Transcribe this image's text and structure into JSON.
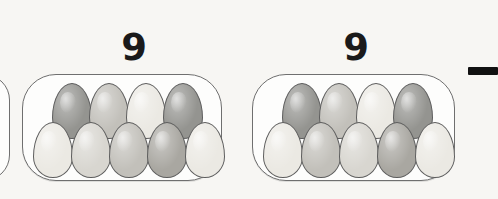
{
  "canvas": {
    "width": 494,
    "height": 199,
    "background": "#f7f6f3"
  },
  "worksheet": {
    "kind": "egg-carton-counting",
    "description": "Two egg cartons each holding nine eggs, labelled with the numeral 9, plus a partially visible carton at the left edge and a dash mark at the upper right.",
    "egg_rows_per_carton": [
      4,
      5
    ],
    "eggs_per_carton": 9
  },
  "labels": {
    "carton_1_count": "9",
    "carton_2_count": "9"
  },
  "colors": {
    "egg_outline": "#5e5e5e",
    "carton_outline": "#6f6f6f",
    "carton_fill": "#fdfdfc",
    "background": "#f7f6f3",
    "dash": "#111111",
    "egg_light": "#ebe9e3",
    "egg_medium_light": "#d8d6d0",
    "egg_medium": "#c2c0ba",
    "egg_medium_dark": "#a9a7a1",
    "egg_dark": "#949490"
  },
  "cartons": [
    {
      "id": "carton-partial-left",
      "partial": true,
      "x": -42,
      "y": 74,
      "w": 52,
      "h": 107,
      "label": null,
      "eggs": []
    },
    {
      "id": "carton-1",
      "partial": false,
      "x": 22,
      "y": 74,
      "w": 200,
      "h": 107,
      "label_x": 110,
      "label_y": 29,
      "label_w": 48,
      "label": "9",
      "eggs": [
        {
          "row": "top",
          "x": 52,
          "y": 83,
          "w": 38,
          "h": 54,
          "shade": "#949490"
        },
        {
          "row": "top",
          "x": 89,
          "y": 83,
          "w": 38,
          "h": 54,
          "shade": "#c2c0ba"
        },
        {
          "row": "top",
          "x": 126,
          "y": 83,
          "w": 38,
          "h": 54,
          "shade": "#ebe9e3"
        },
        {
          "row": "top",
          "x": 163,
          "y": 83,
          "w": 38,
          "h": 54,
          "shade": "#949490"
        },
        {
          "row": "bottom",
          "x": 33,
          "y": 122,
          "w": 38,
          "h": 54,
          "shade": "#ebe9e3"
        },
        {
          "row": "bottom",
          "x": 71,
          "y": 122,
          "w": 38,
          "h": 54,
          "shade": "#d8d6d0"
        },
        {
          "row": "bottom",
          "x": 109,
          "y": 122,
          "w": 38,
          "h": 54,
          "shade": "#c2c0ba"
        },
        {
          "row": "bottom",
          "x": 147,
          "y": 122,
          "w": 38,
          "h": 54,
          "shade": "#a9a7a1"
        },
        {
          "row": "bottom",
          "x": 185,
          "y": 122,
          "w": 38,
          "h": 54,
          "shade": "#ebe9e3"
        }
      ]
    },
    {
      "id": "carton-2",
      "partial": false,
      "x": 252,
      "y": 74,
      "w": 203,
      "h": 107,
      "label_x": 332,
      "label_y": 29,
      "label_w": 48,
      "label": "9",
      "eggs": [
        {
          "row": "top",
          "x": 282,
          "y": 83,
          "w": 38,
          "h": 54,
          "shade": "#949490"
        },
        {
          "row": "top",
          "x": 319,
          "y": 83,
          "w": 38,
          "h": 54,
          "shade": "#c2c0ba"
        },
        {
          "row": "top",
          "x": 356,
          "y": 83,
          "w": 38,
          "h": 54,
          "shade": "#ebe9e3"
        },
        {
          "row": "top",
          "x": 393,
          "y": 83,
          "w": 38,
          "h": 54,
          "shade": "#949490"
        },
        {
          "row": "bottom",
          "x": 263,
          "y": 122,
          "w": 38,
          "h": 54,
          "shade": "#ebe9e3"
        },
        {
          "row": "bottom",
          "x": 301,
          "y": 122,
          "w": 38,
          "h": 54,
          "shade": "#c2c0ba"
        },
        {
          "row": "bottom",
          "x": 339,
          "y": 122,
          "w": 38,
          "h": 54,
          "shade": "#d8d6d0"
        },
        {
          "row": "bottom",
          "x": 377,
          "y": 122,
          "w": 38,
          "h": 54,
          "shade": "#a9a7a1"
        },
        {
          "row": "bottom",
          "x": 415,
          "y": 122,
          "w": 38,
          "h": 54,
          "shade": "#ebe9e3"
        }
      ]
    }
  ],
  "dash": {
    "x": 468,
    "y": 67,
    "w": 30,
    "h": 8
  }
}
